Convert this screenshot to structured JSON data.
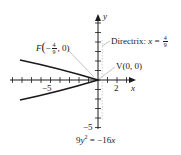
{
  "diagram": {
    "equation": {
      "lhs_coef": "9",
      "lhs_var": "y",
      "lhs_exp": "2",
      "eq": "=",
      "rhs": "−16",
      "rhs_var": "x"
    },
    "axes": {
      "x_label": "x",
      "y_label": "y",
      "x_tick_labels": [
        {
          "value": "−5",
          "pos": -5
        },
        {
          "value": "2",
          "pos": 2
        }
      ],
      "y_tick_labels": [
        {
          "value": "−5",
          "pos": -5
        }
      ],
      "x_range": [
        -9,
        4
      ],
      "y_range": [
        -5,
        6.5
      ]
    },
    "focus": {
      "label_prefix": "F",
      "open": "(",
      "sign": "−",
      "num": "4",
      "den": "9",
      "rest": ", 0)"
    },
    "vertex": {
      "label": "V(0, 0)"
    },
    "directrix": {
      "prefix": "Directrix: ",
      "var": "x",
      "eq": " = ",
      "num": "4",
      "den": "9"
    },
    "colors": {
      "curve": "#1a1a1a",
      "axis": "#1a1a1a",
      "leader": "#9a9a9a"
    }
  }
}
